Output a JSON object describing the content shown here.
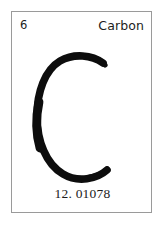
{
  "card": {
    "atomic_number": "6",
    "element_name": "Carbon",
    "element_symbol": "C",
    "atomic_mass": "12. 01078",
    "background_color": "#ffffff",
    "border_color": "#9a9a9a",
    "text_color": "#1d1d1d",
    "symbol_color": "#0d0d0d"
  }
}
